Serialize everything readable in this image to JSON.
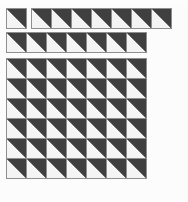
{
  "figure": {
    "title": "",
    "background_color": "#fcfcfc",
    "tile": {
      "name": "half-dark-square",
      "size_px": 21,
      "light_color": "#f4f4f4",
      "dark_color": "#3f3f3f",
      "border_color": "#8e8e8e",
      "orientation": "upper-left light, lower-right dark"
    },
    "groups": [
      {
        "name": "top-single-tile",
        "x": 6,
        "y": 8,
        "columns": 1,
        "rows": 1
      },
      {
        "name": "top-strip-right",
        "x": 31,
        "y": 8,
        "columns": 7,
        "rows": 1
      },
      {
        "name": "second-strip",
        "x": 6,
        "y": 32,
        "columns": 7,
        "rows": 1
      },
      {
        "name": "main-grid",
        "x": 6,
        "y": 58,
        "columns": 7,
        "rows": 6
      }
    ]
  }
}
